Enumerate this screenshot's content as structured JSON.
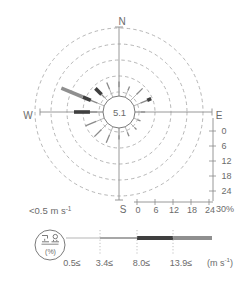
{
  "compass": {
    "n": "N",
    "e": "E",
    "s": "S",
    "w": "W"
  },
  "center_calm_value": "5.1",
  "rulers": {
    "tick_labels": [
      "0",
      "6",
      "12",
      "18",
      "24"
    ],
    "max_label": "30%"
  },
  "legend": {
    "calm_threshold": {
      "base": "<0.5 m s",
      "sup": "-1"
    },
    "calm_circle_korean": "고요",
    "calm_circle_unit": "(%)",
    "class_labels": [
      "0.5≤",
      "3.4≤",
      "8.0≤",
      "13.9≤"
    ],
    "unit_label": {
      "open": "(m s",
      "sup": "-1",
      "close": ")"
    }
  },
  "colors": {
    "class1_thin": "#adadad",
    "class2_medium": "#8a8a8a",
    "class3_black": "#3f3f3f",
    "class4_gray": "#8f8f8f",
    "grid": "#a3a3a3",
    "axis": "#8c8c8c",
    "text": "#6b6b6b",
    "calm_circle_stroke": "#7a7a7a"
  },
  "chart_data": {
    "type": "wind-rose",
    "calm_percent": 5.1,
    "calm_definition": "<0.5 m s⁻¹",
    "radial_unit": "%",
    "radial_ticks": [
      0,
      6,
      12,
      18,
      24
    ],
    "radial_max": 30,
    "grid": "dashed-concentric-circles",
    "speed_class_bounds_ms": [
      "0.5≤",
      "3.4≤",
      "8.0≤",
      "13.9≤"
    ],
    "directions_order": [
      "N",
      "NNE",
      "NE",
      "ENE",
      "E",
      "ESE",
      "SE",
      "SSE",
      "S",
      "SSW",
      "SW",
      "WSW",
      "W",
      "WNW",
      "NW",
      "NNW"
    ],
    "frequencies_percent": {
      "N": [
        3,
        2,
        0,
        0
      ],
      "NNE": [
        2.5,
        1.5,
        0,
        0
      ],
      "NE": [
        3,
        3,
        0,
        0
      ],
      "ENE": [
        2.5,
        2.5,
        1.5,
        0
      ],
      "E": [
        2,
        1.5,
        0,
        0
      ],
      "ESE": [
        1.5,
        1,
        0,
        0
      ],
      "SE": [
        2,
        1,
        0,
        0
      ],
      "SSE": [
        2,
        1.5,
        0,
        0
      ],
      "S": [
        2.5,
        1.5,
        0,
        0
      ],
      "SSW": [
        3,
        3,
        0,
        0
      ],
      "SW": [
        3,
        3.5,
        0,
        0
      ],
      "WSW": [
        3,
        4,
        0,
        0
      ],
      "W": [
        2,
        2.5,
        5.5,
        0
      ],
      "WNW": [
        2.5,
        2.5,
        3,
        8
      ],
      "NW": [
        1.5,
        1.5,
        3,
        0
      ],
      "NNW": [
        3,
        2.5,
        0,
        0
      ]
    }
  }
}
